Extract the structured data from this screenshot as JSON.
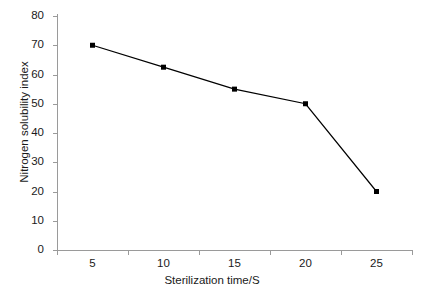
{
  "chart_data": {
    "type": "line",
    "title": "",
    "xlabel": "Sterilization time/S",
    "ylabel": "Nitrogen solubility index",
    "x": [
      5,
      10,
      15,
      20,
      25
    ],
    "values": [
      70,
      62.5,
      55,
      50,
      20
    ],
    "series": [
      {
        "name": "Nitrogen solubility index",
        "values": [
          70,
          62.5,
          55,
          50,
          20
        ]
      }
    ],
    "xlim": [
      2.5,
      27.5
    ],
    "ylim": [
      0,
      80
    ],
    "xticks": [
      5,
      10,
      15,
      20,
      25
    ],
    "yticks": [
      0,
      10,
      20,
      30,
      40,
      50,
      60,
      70,
      80
    ],
    "xtick_labels": [
      "5",
      "10",
      "15",
      "20",
      "25"
    ],
    "ytick_labels": [
      "0",
      "10",
      "20",
      "30",
      "40",
      "50",
      "60",
      "70",
      "80"
    ],
    "grid": false,
    "legend": false,
    "legend_position": "none",
    "marker": "square",
    "line_color": "#000000",
    "marker_color": "#000000",
    "axis_color": "#9a9a9a",
    "background_color": "#ffffff"
  }
}
